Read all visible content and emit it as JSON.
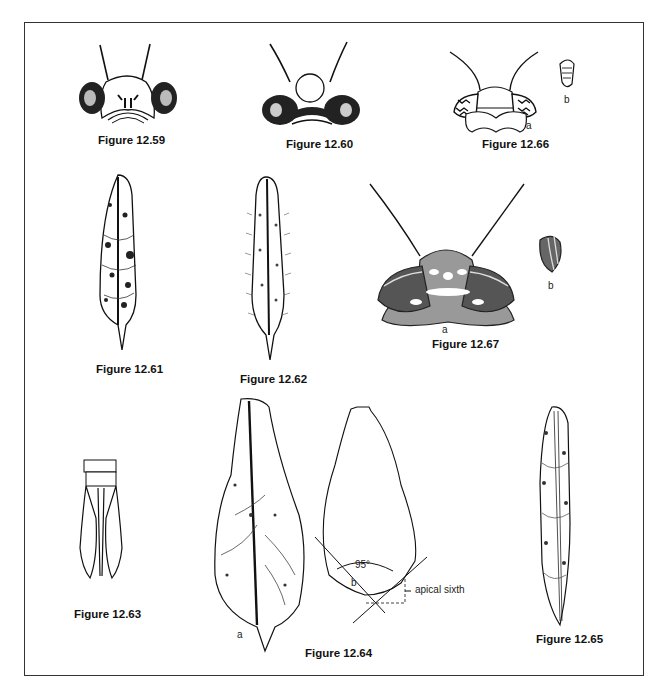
{
  "plate": {
    "figures": [
      {
        "id": "12.59",
        "caption": "Figure 12.59",
        "subject": "head, frontal view"
      },
      {
        "id": "12.60",
        "caption": "Figure 12.60",
        "subject": "head, frontal view, dark-patterned"
      },
      {
        "id": "12.66",
        "caption": "Figure 12.66",
        "subject": "head with eye detail",
        "sublabels": [
          "a",
          "b"
        ]
      },
      {
        "id": "12.61",
        "caption": "Figure 12.61",
        "subject": "mottled forewing"
      },
      {
        "id": "12.62",
        "caption": "Figure 12.62",
        "subject": "setose forewing"
      },
      {
        "id": "12.67",
        "caption": "Figure 12.67",
        "subject": "shaded head with eye detail",
        "sublabels": [
          "a",
          "b"
        ]
      },
      {
        "id": "12.63",
        "caption": "Figure 12.63",
        "subject": "terminal abdominal segments"
      },
      {
        "id": "12.64",
        "caption": "Figure 12.64",
        "subject": "hindwing and apex angle diagram",
        "sublabels": [
          "a",
          "b"
        ],
        "annotations": {
          "angle": "95°",
          "apex_label": "apical sixth"
        }
      },
      {
        "id": "12.65",
        "caption": "Figure 12.65",
        "subject": "narrow reticulate forewing"
      }
    ]
  }
}
